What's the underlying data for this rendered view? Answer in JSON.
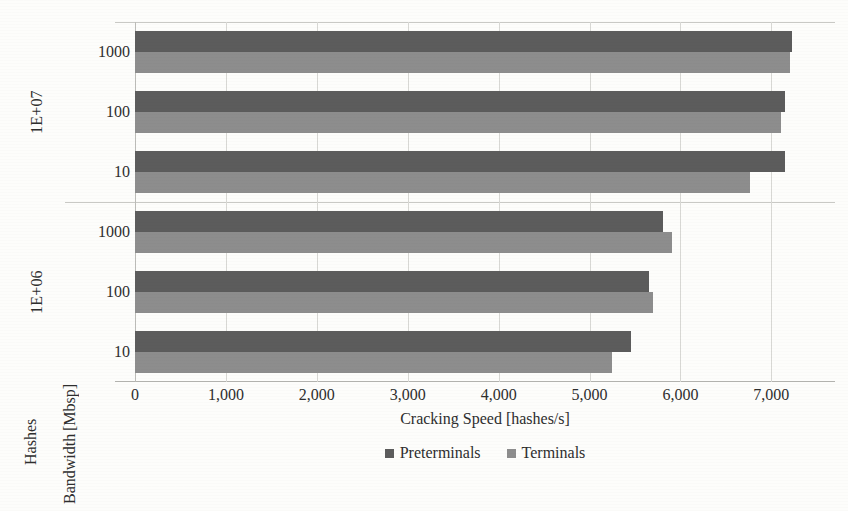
{
  "chart_data": {
    "type": "bar",
    "orientation": "horizontal",
    "title": "",
    "xlabel": "Cracking Speed [hashes/s]",
    "ylabel": "Bandwidth [Mbsp]",
    "outer_ylabel": "Hashes",
    "xlim": [
      0,
      7700
    ],
    "xticks": [
      "0",
      "1,000",
      "2,000",
      "3,000",
      "4,000",
      "5,000",
      "6,000",
      "7,000"
    ],
    "xtick_values": [
      0,
      1000,
      2000,
      3000,
      4000,
      5000,
      6000,
      7000
    ],
    "grid": true,
    "legend_position": "bottom",
    "legend": [
      "Preterminals",
      "Terminals"
    ],
    "series": [
      {
        "name": "Preterminals",
        "color": "#5c5c5c",
        "values": [
          7230,
          7150,
          7150,
          5810,
          5650,
          5460
        ]
      },
      {
        "name": "Terminals",
        "color": "#8d8d8d",
        "values": [
          7200,
          7110,
          6770,
          5910,
          5700,
          5250
        ]
      }
    ],
    "groups": [
      {
        "hashes": "1E+07",
        "categories": [
          "1000",
          "100",
          "10"
        ]
      },
      {
        "hashes": "1E+06",
        "categories": [
          "1000",
          "100",
          "10"
        ]
      }
    ],
    "categories": [
      "1000",
      "100",
      "10",
      "1000",
      "100",
      "10"
    ]
  },
  "axis": {
    "hashes_title": "Hashes",
    "bandwidth_title": "Bandwidth [Mbsp]",
    "bandwidth_title_line1": "Bandwidth",
    "bandwidth_title_line2": "[Mbsp]",
    "x_title": "Cracking Speed [hashes/s]",
    "hashes_groups": [
      "1E+07",
      "1E+06"
    ],
    "bandwidth_ticks": [
      "1000",
      "100",
      "10",
      "1000",
      "100",
      "10"
    ],
    "x_ticks": [
      "0",
      "1,000",
      "2,000",
      "3,000",
      "4,000",
      "5,000",
      "6,000",
      "7,000"
    ]
  },
  "legend": {
    "items": [
      {
        "label": "Preterminals",
        "color": "#5c5c5c"
      },
      {
        "label": "Terminals",
        "color": "#8d8d8d"
      }
    ]
  },
  "colors": {
    "preterminals": "#5c5c5c",
    "terminals": "#8d8d8d",
    "grid": "#d8d8d4",
    "background": "#fdfdfb",
    "text": "#2e2e2e"
  }
}
